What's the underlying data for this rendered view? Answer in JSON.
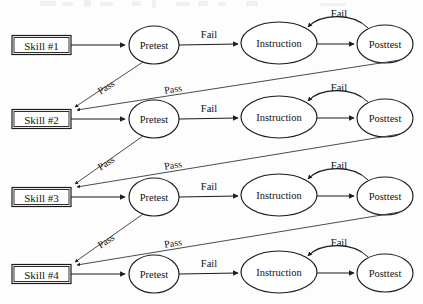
{
  "diagram": {
    "type": "flowchart",
    "background_color": "#fdfdfd",
    "stroke_color": "#1b1b1b",
    "node_fill": "#ffffff",
    "rows": [
      {
        "id": "row-1",
        "skill_label": "Skill  #1",
        "pretest_label": "Pretest",
        "instruction_label": "Instruction",
        "posttest_label": "Posttest",
        "pretest_fail_label": "Fail",
        "posttest_fail_label": "Fail",
        "pretest_pass_label": "Pass",
        "posttest_pass_label": "Pass"
      },
      {
        "id": "row-2",
        "skill_label": "Skill  #2",
        "pretest_label": "Pretest",
        "instruction_label": "Instruction",
        "posttest_label": "Posttest",
        "pretest_fail_label": "Fail",
        "posttest_fail_label": "Fail",
        "pretest_pass_label": "Pass",
        "posttest_pass_label": "Pass"
      },
      {
        "id": "row-3",
        "skill_label": "Skill  #3",
        "pretest_label": "Pretest",
        "instruction_label": "Instruction",
        "posttest_label": "Posttest",
        "pretest_fail_label": "Fail",
        "posttest_fail_label": "Fail",
        "pretest_pass_label": "Pass",
        "posttest_pass_label": "Pass"
      },
      {
        "id": "row-4",
        "skill_label": "Skill  #4",
        "pretest_label": "Pretest",
        "instruction_label": "Instruction",
        "posttest_label": "Posttest",
        "pretest_fail_label": "Fail",
        "posttest_fail_label": "Fail",
        "pretest_pass_label": "",
        "posttest_pass_label": ""
      }
    ]
  }
}
